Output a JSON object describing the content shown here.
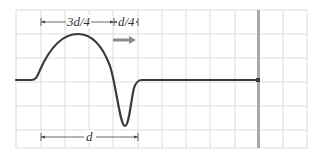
{
  "diagram": {
    "type": "wave-pulse-approaching-wall",
    "grid": {
      "x_lines": [
        16,
        41,
        65,
        89,
        113,
        138,
        162,
        186,
        210,
        235,
        259,
        283,
        307
      ],
      "y_lines": [
        10,
        34,
        58,
        82,
        106,
        130,
        148
      ],
      "color": "#dcdcdc"
    },
    "baseline_y": 80,
    "pulse": {
      "start_x": 33,
      "crest": {
        "x": 78,
        "y": 34
      },
      "trough": {
        "x": 125,
        "y": 126
      },
      "end_x": 140,
      "color": "#3a3a3a"
    },
    "wall": {
      "x": 258,
      "top": 10,
      "bottom": 148,
      "color": "#a8a8a8"
    },
    "direction_arrow": {
      "x1": 113,
      "x2": 136,
      "y": 40,
      "color": "#8c8c8c",
      "meaning": "direction of travel (right)"
    },
    "labels": {
      "crest_width": "3d/4",
      "trough_width": "d/4",
      "total_width": "d"
    },
    "dimension_lines": {
      "top": {
        "y": 22,
        "x_start": 41,
        "x_mid": 114,
        "x_end": 138
      },
      "bottom": {
        "y": 137,
        "x_start": 41,
        "x_end": 138
      }
    }
  }
}
